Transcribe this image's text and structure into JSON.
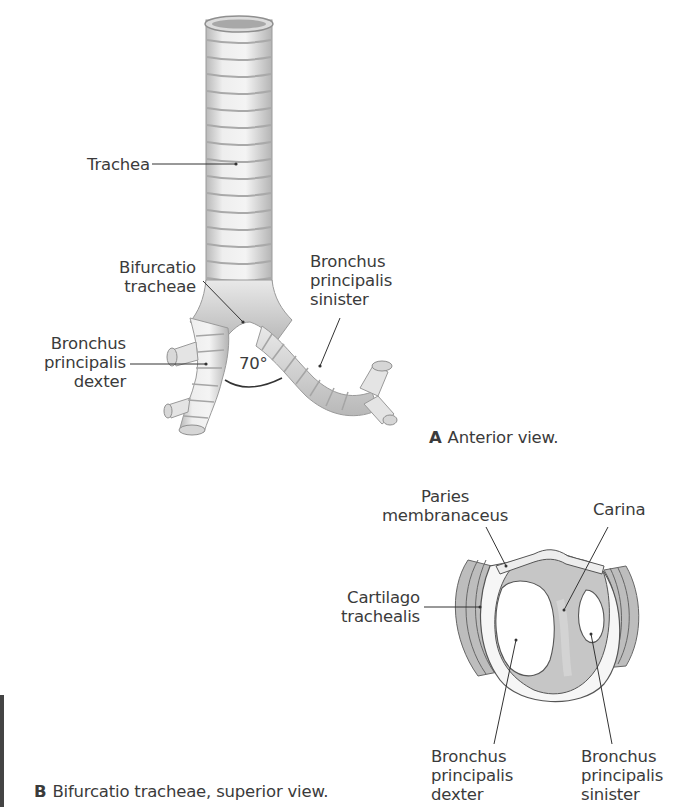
{
  "figure_a": {
    "caption_letter": "A",
    "caption_text": "Anterior view.",
    "labels": {
      "trachea": "Trachea",
      "bifurcatio_line1": "Bifurcatio",
      "bifurcatio_line2": "tracheae",
      "bronchus_dexter_line1": "Bronchus",
      "bronchus_dexter_line2": "principalis",
      "bronchus_dexter_line3": "dexter",
      "bronchus_sinister_line1": "Bronchus",
      "bronchus_sinister_line2": "principalis",
      "bronchus_sinister_line3": "sinister",
      "angle": "70°"
    }
  },
  "figure_b": {
    "caption_letter": "B",
    "caption_text": "Bifurcatio tracheae, superior view.",
    "labels": {
      "paries_line1": "Paries",
      "paries_line2": "membranaceus",
      "carina": "Carina",
      "cartilago_line1": "Cartilago",
      "cartilago_line2": "trachealis",
      "bronchus_dexter_line1": "Bronchus",
      "bronchus_dexter_line2": "principalis",
      "bronchus_dexter_line3": "dexter",
      "bronchus_sinister_line1": "Bronchus",
      "bronchus_sinister_line2": "principalis",
      "bronchus_sinister_line3": "sinister"
    }
  },
  "colors": {
    "tissue_light": "#ececec",
    "tissue_shadow": "#bdbdbd",
    "membrane_gray": "#c6c6c6",
    "leader_line": "#333333"
  }
}
